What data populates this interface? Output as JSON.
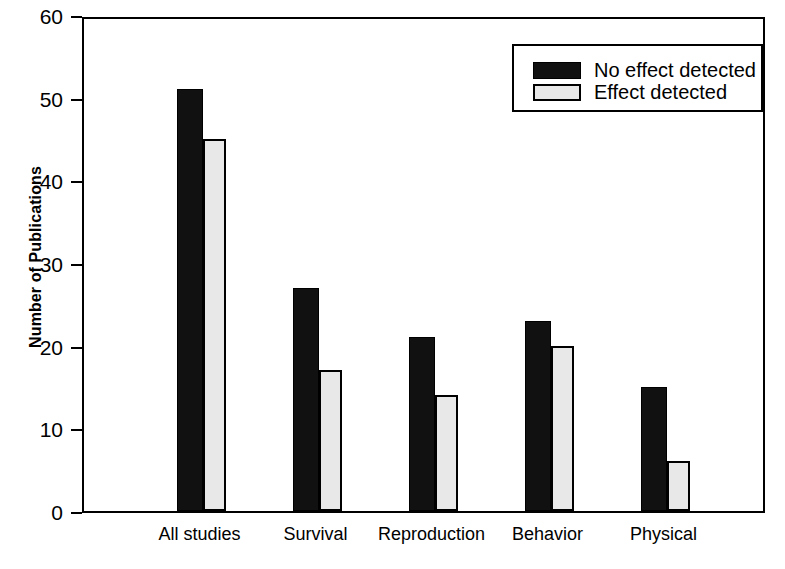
{
  "chart_data": {
    "type": "bar",
    "title": "",
    "xlabel": "",
    "ylabel": "Number of Publications",
    "categories": [
      "All studies",
      "Survival",
      "Reproduction",
      "Behavior",
      "Physical"
    ],
    "series": [
      {
        "name": "No effect detected",
        "color": "#111111",
        "values": [
          51,
          27,
          21,
          23,
          15
        ]
      },
      {
        "name": "Effect detected",
        "color": "#e8e8e8",
        "values": [
          45,
          17,
          14,
          20,
          6
        ]
      }
    ],
    "ylim": [
      0,
      60
    ],
    "yticks": [
      0,
      10,
      20,
      30,
      40,
      50,
      60
    ],
    "ytick_labels": [
      "0",
      "10",
      "20",
      "30",
      "40",
      "50",
      "60"
    ],
    "grid": false,
    "legend_position": "top-right"
  },
  "axes": {
    "y_title": "Number of Publications"
  },
  "legend": {
    "entries": [
      {
        "label": "No effect detected",
        "swatch": "dark"
      },
      {
        "label": "Effect detected",
        "swatch": "light"
      }
    ]
  }
}
